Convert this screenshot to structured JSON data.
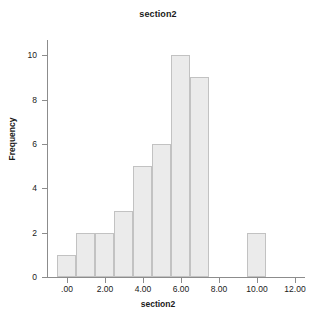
{
  "chart_data": {
    "type": "bar",
    "title": "section2",
    "xlabel": "section2",
    "ylabel": "Frequency",
    "grid": false,
    "legend": null,
    "bin_width": 1.0,
    "xlim": [
      -1.0,
      12.6
    ],
    "ylim": [
      0,
      10.6
    ],
    "x_ticks": [
      ".00",
      "2.00",
      "4.00",
      "6.00",
      "8.00",
      "10.00",
      "12.00"
    ],
    "x_tick_values": [
      0,
      2,
      4,
      6,
      8,
      10,
      12
    ],
    "y_ticks": [
      "0",
      "2",
      "4",
      "6",
      "8",
      "10"
    ],
    "y_tick_values": [
      0,
      2,
      4,
      6,
      8,
      10
    ],
    "categories": [
      "-0.5",
      "0.5",
      "1.5",
      "2.5",
      "3.5",
      "4.5",
      "5.5",
      "6.5",
      "9.5"
    ],
    "bin_starts": [
      -0.5,
      0.5,
      1.5,
      2.5,
      3.5,
      4.5,
      5.5,
      6.5,
      9.5
    ],
    "values": [
      1,
      2,
      2,
      3,
      5,
      6,
      10,
      9,
      2
    ],
    "bar_fill": "#ebebeb",
    "bar_border": "#c2c2c2",
    "axis_color": "#8c8c8c",
    "text_color": "#1a1a1a",
    "background": "#ffffff"
  }
}
